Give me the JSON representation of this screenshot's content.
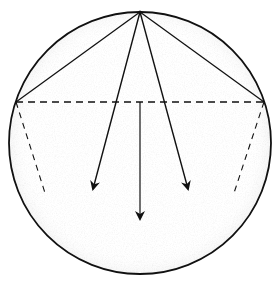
{
  "diagram": {
    "type": "geometric-force-diagram",
    "colors": {
      "stroke": "#111111",
      "background": "#ffffff",
      "stipple": "#9a9a9a"
    },
    "circle": {
      "cx": 140,
      "cy": 143,
      "r": 131
    },
    "apex": {
      "x": 140,
      "y": 12
    },
    "chord_points": {
      "left": {
        "x": 16,
        "y": 102
      },
      "right": {
        "x": 264,
        "y": 102
      }
    },
    "dashed_lines": [
      {
        "name": "horizontal-chord",
        "x1": 16,
        "y1": 102,
        "x2": 264,
        "y2": 102
      },
      {
        "name": "left-side",
        "x1": 16,
        "y1": 102,
        "x2": 46,
        "y2": 196
      },
      {
        "name": "right-side",
        "x1": 264,
        "y1": 102,
        "x2": 233,
        "y2": 196
      }
    ],
    "solid_chords": [
      {
        "name": "apex-to-left",
        "x1": 140,
        "y1": 12,
        "x2": 16,
        "y2": 102
      },
      {
        "name": "apex-to-right",
        "x1": 140,
        "y1": 12,
        "x2": 264,
        "y2": 102
      }
    ],
    "arrows": [
      {
        "name": "left-arrow",
        "x1": 140,
        "y1": 12,
        "x2": 93,
        "y2": 189
      },
      {
        "name": "right-arrow",
        "x1": 140,
        "y1": 12,
        "x2": 188,
        "y2": 189
      },
      {
        "name": "center-arrow",
        "x1": 140,
        "y1": 102,
        "x2": 140,
        "y2": 219
      }
    ]
  }
}
